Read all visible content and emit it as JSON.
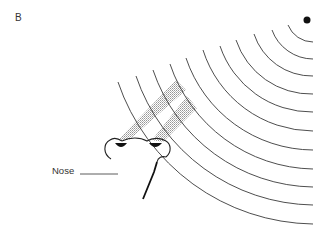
{
  "figure": {
    "panel_label": "B",
    "labels": {
      "nose": "Nose"
    },
    "elements": {
      "source": "odor-source-dot",
      "wavefronts": "concentric-odor-arcs",
      "beams": [
        "left-nostril-beam",
        "right-nostril-beam"
      ],
      "nostrils": [
        "left-nostril",
        "right-nostril"
      ]
    },
    "colors": {
      "line": "#333333",
      "source": "#111111",
      "beam_shade": "#9a9a9a"
    },
    "arc_count": 11
  }
}
